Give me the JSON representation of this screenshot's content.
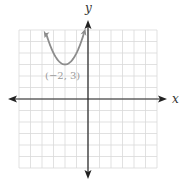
{
  "graph": {
    "x_axis_label": "x",
    "y_axis_label": "y",
    "x_range": [
      -6,
      6
    ],
    "y_range": [
      -6,
      6
    ],
    "grid_step": 1,
    "curve": {
      "type": "parabola",
      "equation": "y = (x + 2)^2 + 3",
      "vertex": [
        -2,
        3
      ],
      "color": "#8c8c8c"
    },
    "vertex_label": "(−2, 3)",
    "colors": {
      "grid": "#d9d9d9",
      "axis": "#222222",
      "curve": "#8c8c8c",
      "label": "#9a9a9a"
    }
  }
}
